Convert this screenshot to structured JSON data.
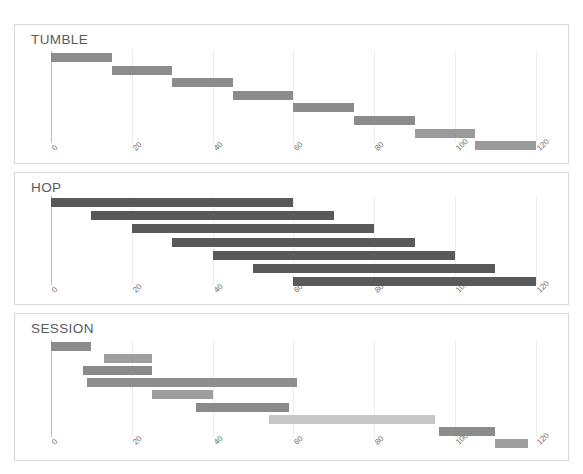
{
  "chart_data": [
    {
      "type": "bar",
      "title": "TUMBLE",
      "orientation": "horizontal-range",
      "xlabel": "",
      "ylabel": "",
      "xlim": [
        0,
        120
      ],
      "xticks": [
        0,
        20,
        40,
        60,
        80,
        100,
        120
      ],
      "xtick_labels": [
        "0",
        "20",
        "40",
        "60",
        "80",
        "100",
        "120"
      ],
      "grid": true,
      "legend": "none",
      "bar_color": "#8c8c8c",
      "bars": [
        {
          "index": 1,
          "start": 0,
          "end": 15,
          "length": 15,
          "color": "#8c8c8c"
        },
        {
          "index": 2,
          "start": 15,
          "end": 30,
          "length": 15,
          "color": "#8c8c8c"
        },
        {
          "index": 3,
          "start": 30,
          "end": 45,
          "length": 15,
          "color": "#8c8c8c"
        },
        {
          "index": 4,
          "start": 45,
          "end": 60,
          "length": 15,
          "color": "#8c8c8c"
        },
        {
          "index": 5,
          "start": 60,
          "end": 75,
          "length": 15,
          "color": "#8c8c8c"
        },
        {
          "index": 6,
          "start": 75,
          "end": 90,
          "length": 15,
          "color": "#8c8c8c"
        },
        {
          "index": 7,
          "start": 90,
          "end": 105,
          "length": 15,
          "color": "#9a9a9a"
        },
        {
          "index": 8,
          "start": 105,
          "end": 120,
          "length": 15,
          "color": "#9a9a9a"
        }
      ]
    },
    {
      "type": "bar",
      "title": "HOP",
      "orientation": "horizontal-range",
      "xlabel": "",
      "ylabel": "",
      "xlim": [
        0,
        120
      ],
      "xticks": [
        0,
        20,
        40,
        60,
        80,
        100,
        120
      ],
      "xtick_labels": [
        "0",
        "20",
        "40",
        "60",
        "80",
        "100",
        "120"
      ],
      "grid": true,
      "legend": "none",
      "bar_color": "#595959",
      "bars": [
        {
          "index": 1,
          "start": 0,
          "end": 60,
          "length": 60,
          "color": "#595959"
        },
        {
          "index": 2,
          "start": 10,
          "end": 70,
          "length": 60,
          "color": "#595959"
        },
        {
          "index": 3,
          "start": 20,
          "end": 80,
          "length": 60,
          "color": "#595959"
        },
        {
          "index": 4,
          "start": 30,
          "end": 90,
          "length": 60,
          "color": "#595959"
        },
        {
          "index": 5,
          "start": 40,
          "end": 100,
          "length": 60,
          "color": "#595959"
        },
        {
          "index": 6,
          "start": 50,
          "end": 110,
          "length": 60,
          "color": "#595959"
        },
        {
          "index": 7,
          "start": 60,
          "end": 120,
          "length": 60,
          "color": "#595959"
        }
      ]
    },
    {
      "type": "bar",
      "title": "SESSION",
      "orientation": "horizontal-range",
      "xlabel": "",
      "ylabel": "",
      "xlim": [
        0,
        120
      ],
      "xticks": [
        0,
        20,
        40,
        60,
        80,
        100,
        120
      ],
      "xtick_labels": [
        "0",
        "20",
        "40",
        "60",
        "80",
        "100",
        "120"
      ],
      "grid": true,
      "legend": "none",
      "bar_color": "#8c8c8c",
      "bars": [
        {
          "index": 1,
          "start": 0,
          "end": 10,
          "length": 10,
          "color": "#8c8c8c"
        },
        {
          "index": 2,
          "start": 13,
          "end": 25,
          "length": 12,
          "color": "#9e9e9e"
        },
        {
          "index": 3,
          "start": 8,
          "end": 25,
          "length": 17,
          "color": "#8a8a8a"
        },
        {
          "index": 4,
          "start": 9,
          "end": 61,
          "length": 52,
          "color": "#8e8e8e"
        },
        {
          "index": 5,
          "start": 25,
          "end": 40,
          "length": 15,
          "color": "#9e9e9e"
        },
        {
          "index": 6,
          "start": 36,
          "end": 59,
          "length": 23,
          "color": "#8a8a8a"
        },
        {
          "index": 7,
          "start": 54,
          "end": 95,
          "length": 41,
          "color": "#c7c7c7"
        },
        {
          "index": 8,
          "start": 96,
          "end": 110,
          "length": 14,
          "color": "#8c8c8c"
        },
        {
          "index": 9,
          "start": 110,
          "end": 118,
          "length": 8,
          "color": "#9e9e9e"
        }
      ]
    }
  ],
  "panels": {
    "tumble": {
      "title": "TUMBLE"
    },
    "hop": {
      "title": "HOP"
    },
    "session": {
      "title": "SESSION"
    }
  }
}
